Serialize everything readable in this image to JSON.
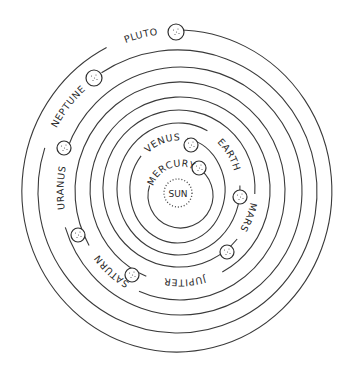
{
  "diagram": {
    "sun": {
      "label": "SUN",
      "cx": 178,
      "cy": 193,
      "r": 14
    },
    "planets": [
      {
        "name": "mercury",
        "label": "MERCURY",
        "orbit": {
          "cx": 180.5,
          "cy": 195.5,
          "rx": 32.5,
          "ry": 32.5
        },
        "planet": {
          "x": 199,
          "y": 168,
          "r": 7
        },
        "label_start": 200,
        "label_end": 296
      },
      {
        "name": "venus",
        "label": "VENUS",
        "orbit": {
          "cx": 177.5,
          "cy": 190,
          "rx": 47.5,
          "ry": 53
        },
        "planet": {
          "x": 191,
          "y": 145,
          "r": 7
        },
        "label_start": 222,
        "label_end": 280
      },
      {
        "name": "earth",
        "label": "EARTH",
        "orbit": {
          "cx": 178.5,
          "cy": 189,
          "rx": 61.5,
          "ry": 66
        },
        "planet": {
          "x": 240,
          "y": 197,
          "r": 7
        },
        "label_start": 300,
        "label_end": 355
      },
      {
        "name": "mars",
        "label": "MARS",
        "orbit": {
          "cx": 179,
          "cy": 188.5,
          "rx": 76,
          "ry": 78.5
        },
        "planet": {
          "x": 227,
          "y": 252,
          "r": 7
        },
        "label_start": 6,
        "label_end": 38
      },
      {
        "name": "jupiter",
        "label": "JUPITER",
        "orbit": {
          "cx": 180,
          "cy": 190,
          "rx": 90,
          "ry": 93
        },
        "planet": {
          "x": 132,
          "y": 275,
          "r": 7
        },
        "label_start": 64,
        "label_end": 110
      },
      {
        "name": "saturn",
        "label": "SATURN",
        "orbit": {
          "cx": 180,
          "cy": 191,
          "rx": 105,
          "ry": 109
        },
        "planet": {
          "x": 78,
          "y": 235,
          "r": 7
        },
        "label_start": 115,
        "label_end": 148
      },
      {
        "name": "uranus",
        "label": "URANUS",
        "orbit": {
          "cx": 181,
          "cy": 191,
          "rx": 121,
          "ry": 124
        },
        "planet": {
          "x": 64,
          "y": 148,
          "r": 7
        },
        "label_start": 165,
        "label_end": 198
      },
      {
        "name": "neptune",
        "label": "NEPTUNE",
        "orbit": {
          "cx": 177.5,
          "cy": 191.5,
          "rx": 139.5,
          "ry": 141.5
        },
        "planet": {
          "x": 94,
          "y": 78,
          "r": 8
        },
        "label_start": 200,
        "label_end": 235
      },
      {
        "name": "pluto",
        "label": "PLUTO",
        "orbit": {
          "cx": 177,
          "cy": 191,
          "rx": 155,
          "ry": 161
        },
        "planet": {
          "x": 176,
          "y": 32,
          "r": 8
        },
        "label_start": 245,
        "label_end": 268
      }
    ]
  }
}
